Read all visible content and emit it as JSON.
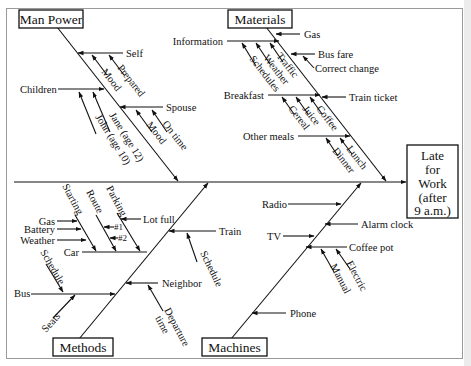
{
  "diagram": {
    "type": "fishbone",
    "effect": {
      "lines": [
        "Late",
        "for",
        "Work",
        "(after",
        "9 a.m.)"
      ]
    },
    "categories": {
      "man_power": {
        "label": "Man Power",
        "causes": {
          "self": {
            "label": "Self",
            "sub": [
              "Mood",
              "Prepared"
            ]
          },
          "children": {
            "label": "Children",
            "sub": [
              "Jane (age 12)",
              "John (age 10)"
            ]
          },
          "spouse": {
            "label": "Spouse",
            "sub": [
              "Mood",
              "On time"
            ]
          }
        }
      },
      "materials": {
        "label": "Materials",
        "causes": {
          "gas": {
            "label": "Gas"
          },
          "information": {
            "label": "Information",
            "sub": [
              "Traffic",
              "Weather",
              "Schedules"
            ]
          },
          "bus_fare": {
            "label": "Bus fare",
            "sub": [
              "Correct change"
            ]
          },
          "breakfast": {
            "label": "Breakfast",
            "sub": [
              "Coffee",
              "Juice",
              "Cereal"
            ]
          },
          "train_ticket": {
            "label": "Train ticket"
          },
          "other_meals": {
            "label": "Other meals",
            "sub": [
              "Lunch",
              "Dinner"
            ]
          }
        }
      },
      "methods": {
        "label": "Methods",
        "causes": {
          "car": {
            "label": "Car",
            "sub": [
              "Starting",
              "Route",
              "Parking"
            ],
            "starting_sub": [
              "Gas",
              "Battery",
              "Weather"
            ],
            "route_sub": [
              "#1",
              "#2"
            ],
            "parking_sub": [
              "Lot full"
            ]
          },
          "train": {
            "label": "Train",
            "sub": [
              "Schedule"
            ]
          },
          "bus": {
            "label": "Bus",
            "sub": [
              "Schedule",
              "Seats"
            ]
          },
          "neighbor": {
            "label": "Neighbor",
            "sub": [
              "Departure",
              "time"
            ]
          }
        }
      },
      "machines": {
        "label": "Machines",
        "causes": {
          "radio": {
            "label": "Radio"
          },
          "alarm_clock": {
            "label": "Alarm clock"
          },
          "tv": {
            "label": "TV"
          },
          "coffee_pot": {
            "label": "Coffee pot",
            "sub": [
              "Manual",
              "Electric"
            ]
          },
          "phone": {
            "label": "Phone"
          }
        }
      }
    }
  }
}
